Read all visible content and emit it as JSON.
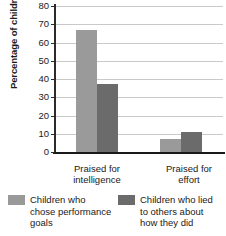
{
  "chart_data": {
    "type": "bar",
    "title": "",
    "xlabel": "",
    "ylabel": "Percentage of children",
    "ylim": [
      0,
      80
    ],
    "ytick_step": 10,
    "yticks": [
      80,
      70,
      60,
      50,
      40,
      30,
      20,
      10,
      0
    ],
    "grid": true,
    "legend_position": "bottom",
    "categories": [
      "Praised for intelligence",
      "Praised for effort"
    ],
    "category_lines": [
      [
        "Praised for",
        "intelligence"
      ],
      [
        "Praised for",
        "effort"
      ]
    ],
    "series": [
      {
        "name": "Children who chose performance goals",
        "name_lines": [
          "Children who",
          "chose performance",
          "goals"
        ],
        "color": "#9a9a9a",
        "values": [
          67,
          7
        ]
      },
      {
        "name": "Children who lied to others about how they did",
        "name_lines": [
          "Children who lied",
          "to others about",
          "how they did"
        ],
        "color": "#6b6b6b",
        "values": [
          37.5,
          11
        ]
      }
    ]
  },
  "colors": {
    "light_bar": "#9a9a9a",
    "dark_bar": "#6b6b6b",
    "gridline": "#c9c9c9",
    "axis": "#1a1a1a",
    "background": "#ffffff"
  }
}
